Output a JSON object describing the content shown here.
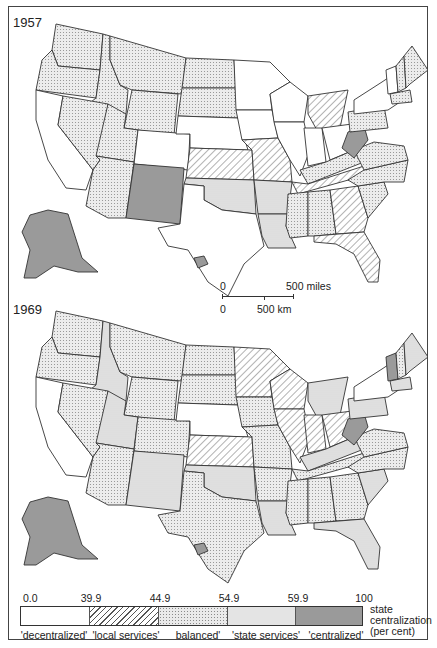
{
  "maps": [
    {
      "year": "1957",
      "states": {
        "WA": "balanced",
        "OR": "balanced",
        "CA": "decentralized",
        "ID": "balanced",
        "NV": "balanced",
        "MT": "balanced",
        "WY": "balanced",
        "UT": "balanced",
        "CO": "decentralized",
        "AZ": "balanced",
        "NM": "centralized",
        "ND": "balanced",
        "SD": "balanced",
        "NE": "decentralized",
        "KS": "local_services",
        "OK": "state_services",
        "TX": "decentralized",
        "MN": "decentralized",
        "IA": "decentralized",
        "MO": "local_services",
        "AR": "state_services",
        "LA": "state_services",
        "WI": "decentralized",
        "IL": "decentralized",
        "MI": "local_services",
        "IN": "decentralized",
        "OH": "decentralized",
        "KY": "balanced",
        "TN": "local_services",
        "MS": "balanced",
        "AL": "balanced",
        "GA": "local_services",
        "FL": "local_services",
        "SC": "balanced",
        "NC": "balanced",
        "VA": "balanced",
        "WV": "centralized",
        "PA": "balanced",
        "NY": "decentralized",
        "ME": "balanced",
        "NH": "balanced",
        "VT": "decentralized",
        "MA": "balanced",
        "AK": "centralized",
        "HI": "centralized"
      }
    },
    {
      "year": "1969",
      "states": {
        "WA": "balanced",
        "OR": "balanced",
        "CA": "decentralized",
        "ID": "state_services",
        "NV": "balanced",
        "MT": "balanced",
        "WY": "balanced",
        "UT": "state_services",
        "CO": "balanced",
        "AZ": "balanced",
        "NM": "state_services",
        "ND": "balanced",
        "SD": "balanced",
        "NE": "decentralized",
        "KS": "local_services",
        "OK": "state_services",
        "TX": "balanced",
        "MN": "local_services",
        "IA": "balanced",
        "MO": "balanced",
        "AR": "balanced",
        "LA": "state_services",
        "WI": "local_services",
        "IL": "local_services",
        "MI": "state_services",
        "IN": "local_services",
        "OH": "local_services",
        "KY": "state_services",
        "TN": "balanced",
        "MS": "balanced",
        "AL": "balanced",
        "GA": "balanced",
        "FL": "state_services",
        "SC": "state_services",
        "NC": "balanced",
        "VA": "balanced",
        "WV": "centralized",
        "PA": "state_services",
        "NY": "decentralized",
        "ME": "state_services",
        "NH": "balanced",
        "VT": "centralized",
        "MA": "state_services",
        "AK": "centralized",
        "HI": "centralized"
      }
    }
  ],
  "scale_bar": {
    "miles_zero": "0",
    "miles_label": "500 miles",
    "km_zero": "0",
    "km_label": "500 km"
  },
  "legend": {
    "breaks": [
      "0.0",
      "39.9",
      "44.9",
      "54.9",
      "59.9",
      "100"
    ],
    "categories": [
      {
        "key": "decentralized",
        "label": "'decentralized'"
      },
      {
        "key": "local_services",
        "label": "'local services'"
      },
      {
        "key": "balanced",
        "label": "balanced'"
      },
      {
        "key": "state_services",
        "label": "'state services'"
      },
      {
        "key": "centralized",
        "label": "'centralized'"
      }
    ],
    "unit_line1": "state",
    "unit_line2": "centralization",
    "unit_line3": "(per cent)"
  },
  "colors": {
    "border": "#333333",
    "centralized": "#9a9a9a",
    "state_services": "#e4e4e4",
    "balanced": "#eaeaea",
    "decentralized": "#ffffff"
  }
}
